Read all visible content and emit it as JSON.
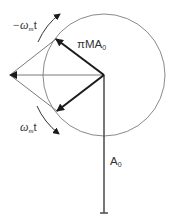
{
  "diagram": {
    "type": "phasor-diagram",
    "labels": {
      "neg_rotation": {
        "prefix": "−ω",
        "sub": "m",
        "suffix": "t"
      },
      "pos_rotation": {
        "prefix": "ω",
        "sub": "m",
        "suffix": "t"
      },
      "sideband_amplitude": {
        "main": "πMA",
        "sub": "0"
      },
      "carrier_amplitude": {
        "main": "A",
        "sub": "0"
      }
    },
    "colors": {
      "background": "#ffffff",
      "phasor": "#1a1a1a",
      "construction_line": "#7a7a7a",
      "circle": "#8a8a8a",
      "carrier": "#4a4a4a",
      "text": "#333333"
    }
  }
}
